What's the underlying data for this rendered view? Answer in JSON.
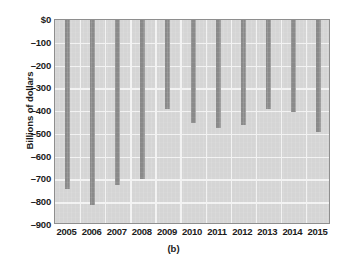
{
  "chart_data": {
    "type": "bar",
    "title": "",
    "subtitle": "",
    "caption": "(b)",
    "xlabel": "",
    "ylabel": "Billions of dollars",
    "categories": [
      "2005",
      "2006",
      "2007",
      "2008",
      "2009",
      "2010",
      "2011",
      "2012",
      "2013",
      "2014",
      "2015"
    ],
    "values": [
      -740,
      -810,
      -725,
      -700,
      -390,
      -450,
      -475,
      -460,
      -390,
      -405,
      -490
    ],
    "series": [
      {
        "name": "Balance",
        "values": [
          -740,
          -810,
          -725,
          -700,
          -390,
          -450,
          -475,
          -460,
          -390,
          -405,
          -490
        ]
      }
    ],
    "ylim": [
      -900,
      0
    ],
    "ytick_values": [
      0,
      -100,
      -200,
      -300,
      -400,
      -500,
      -600,
      -700,
      -800,
      -900
    ],
    "ytick_labels": [
      "$0",
      "–100",
      "–200",
      "–300",
      "–400",
      "–500",
      "–600",
      "–700",
      "–800",
      "–900"
    ],
    "grid": true,
    "legend": null,
    "colors": {
      "bar": "#8a8a8a",
      "plot_background": "#d5d5d5",
      "gridline": "#f2f2f2",
      "axis_border": "#8e8e8e",
      "text": "#1b1b1b",
      "page_background": "#ffffff"
    }
  }
}
